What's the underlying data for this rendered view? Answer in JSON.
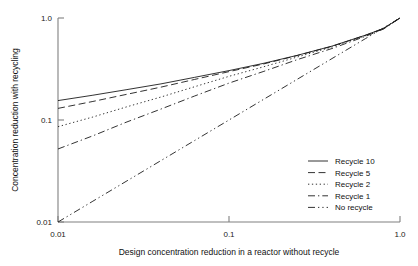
{
  "chart_data": {
    "type": "line",
    "title": "",
    "xlabel": "Design concentration reduction in a reactor without recycle",
    "ylabel": "Concentration reduction with recycling",
    "xscale": "log",
    "yscale": "log",
    "xlim": [
      0.01,
      1.0
    ],
    "ylim": [
      0.01,
      1.0
    ],
    "xticks": [
      0.01,
      0.1,
      1.0
    ],
    "xtick_labels": [
      "0.01",
      "0.1",
      "1.0"
    ],
    "yticks": [
      0.01,
      0.1,
      1.0
    ],
    "ytick_labels": [
      "0.01",
      "0.1",
      "1.0"
    ],
    "grid": false,
    "legend_position": "lower right",
    "x": [
      0.01,
      0.016,
      0.025,
      0.04,
      0.063,
      0.1,
      0.16,
      0.25,
      0.4,
      0.63,
      0.8,
      1.0
    ],
    "series": [
      {
        "name": "Recycle 10",
        "dash": "solid",
        "values": [
          0.155,
          0.175,
          0.198,
          0.226,
          0.262,
          0.305,
          0.36,
          0.43,
          0.53,
          0.68,
          0.79,
          1.0
        ]
      },
      {
        "name": "Recycle 5",
        "dash": "dashed",
        "values": [
          0.13,
          0.152,
          0.178,
          0.21,
          0.25,
          0.298,
          0.355,
          0.428,
          0.528,
          0.678,
          0.788,
          1.0
        ]
      },
      {
        "name": "Recycle 2",
        "dash": "dotted",
        "values": [
          0.086,
          0.107,
          0.134,
          0.168,
          0.212,
          0.268,
          0.333,
          0.414,
          0.52,
          0.672,
          0.785,
          1.0
        ]
      },
      {
        "name": "Recycle 1",
        "dash": "dashdot",
        "values": [
          0.052,
          0.07,
          0.095,
          0.128,
          0.172,
          0.23,
          0.3,
          0.39,
          0.502,
          0.662,
          0.778,
          1.0
        ]
      },
      {
        "name": "No recycle",
        "dash": "dashdotdot",
        "values": [
          0.01,
          0.016,
          0.025,
          0.04,
          0.063,
          0.1,
          0.16,
          0.25,
          0.4,
          0.63,
          0.8,
          1.0
        ]
      }
    ]
  },
  "legend": {
    "entries": [
      {
        "label": "Recycle 10"
      },
      {
        "label": "Recycle 5"
      },
      {
        "label": "Recycle 2"
      },
      {
        "label": "Recycle 1"
      },
      {
        "label": "No recycle"
      }
    ]
  },
  "axes": {
    "x_title": "Design concentration reduction in a reactor without recycle",
    "y_title": "Concentration reduction with recycling",
    "x_tick_0": "0.01",
    "x_tick_1": "0.1",
    "x_tick_2": "1.0",
    "y_tick_0": "0.01",
    "y_tick_1": "0.1",
    "y_tick_2": "1.0"
  },
  "colors": {
    "axis": "#808080",
    "curve": "#1c1c1c",
    "text": "#111111",
    "background": "#ffffff"
  }
}
